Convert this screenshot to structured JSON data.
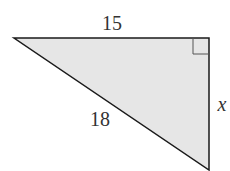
{
  "diagram": {
    "type": "right-triangle",
    "fill_color": "#e6e6e6",
    "stroke_color": "#1a1a1a",
    "labels": {
      "top_side": "15",
      "hypotenuse": "18",
      "right_side": "x"
    },
    "right_angle_marker": true
  }
}
